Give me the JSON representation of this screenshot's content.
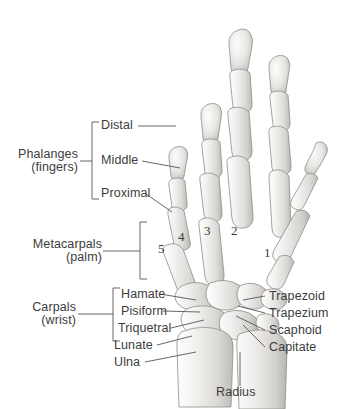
{
  "figure": {
    "background": "#ffffff",
    "text_color": "#3c3c3c",
    "bone_fill_light": "#f2f1ef",
    "bone_fill_mid": "#d8d7d4",
    "bone_outline": "#8d8d8a"
  },
  "groups": {
    "phalanges": {
      "label": "Phalanges",
      "sublabel": "(fingers)"
    },
    "metacarpals": {
      "label": "Metacarpals",
      "sublabel": "(palm)"
    },
    "carpals": {
      "label": "Carpals",
      "sublabel": "(wrist)"
    }
  },
  "phalange_rows": [
    {
      "label": "Distal"
    },
    {
      "label": "Middle"
    },
    {
      "label": "Proximal"
    }
  ],
  "metacarpal_numbers": [
    "5",
    "4",
    "3",
    "2",
    "1"
  ],
  "carpal_labels_left": [
    {
      "label": "Hamate"
    },
    {
      "label": "Pisiform"
    },
    {
      "label": "Triquetral"
    },
    {
      "label": "Lunate"
    }
  ],
  "carpal_labels_right": [
    {
      "label": "Trapezoid"
    },
    {
      "label": "Trapezium"
    },
    {
      "label": "Scaphoid"
    },
    {
      "label": "Capitate"
    }
  ],
  "forearm_labels": [
    {
      "label": "Ulna"
    },
    {
      "label": "Radius"
    }
  ]
}
